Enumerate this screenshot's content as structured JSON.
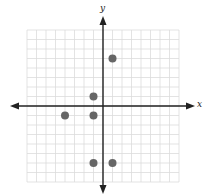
{
  "chart_data": {
    "type": "scatter",
    "title": "",
    "xlabel": "x",
    "ylabel": "y",
    "xlim": [
      -8,
      8
    ],
    "ylim": [
      -8,
      8
    ],
    "grid": true,
    "legend": null,
    "tick_labels": false,
    "series": [
      {
        "name": "points",
        "points": [
          {
            "x": 1,
            "y": 5
          },
          {
            "x": -1,
            "y": 1
          },
          {
            "x": -4,
            "y": -1
          },
          {
            "x": -1,
            "y": -1
          },
          {
            "x": -1,
            "y": -6
          },
          {
            "x": 1,
            "y": -6
          }
        ]
      }
    ]
  },
  "colors": {
    "grid": "#dcdcdc",
    "axis": "#222222",
    "point": "#666666"
  }
}
